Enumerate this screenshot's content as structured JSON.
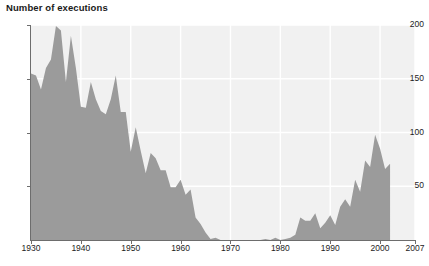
{
  "chart_data": {
    "type": "area",
    "title": "Number of executions",
    "xlabel": "",
    "ylabel": "Number of executions",
    "xlim": [
      1930,
      2007
    ],
    "ylim": [
      0,
      200
    ],
    "grid": true,
    "legend": "none",
    "fill_color": "#9b9b9b",
    "plot_background": "#f1f1f1",
    "gridline_color": "#ffffff",
    "axis_color": "#6d6d6d",
    "x_ticks": [
      1930,
      1940,
      1950,
      1960,
      1970,
      1980,
      1990,
      2000,
      2007
    ],
    "x_tick_labels": [
      "1930",
      "1940",
      "1950",
      "1960",
      "1970",
      "1980",
      "1990",
      "2000",
      "2007"
    ],
    "y_ticks": [
      50,
      100,
      150,
      200
    ],
    "y_tick_labels": [
      "50",
      "100",
      "150",
      "200"
    ],
    "x": [
      1930,
      1931,
      1932,
      1933,
      1934,
      1935,
      1936,
      1937,
      1938,
      1939,
      1940,
      1941,
      1942,
      1943,
      1944,
      1945,
      1946,
      1947,
      1948,
      1949,
      1950,
      1951,
      1952,
      1953,
      1954,
      1955,
      1956,
      1957,
      1958,
      1959,
      1960,
      1961,
      1962,
      1963,
      1964,
      1965,
      1966,
      1967,
      1968,
      1969,
      1970,
      1971,
      1972,
      1973,
      1974,
      1975,
      1976,
      1977,
      1978,
      1979,
      1980,
      1981,
      1982,
      1983,
      1984,
      1985,
      1986,
      1987,
      1988,
      1989,
      1990,
      1991,
      1992,
      1993,
      1994,
      1995,
      1996,
      1997,
      1998,
      1999,
      2000,
      2001,
      2002
    ],
    "values": [
      155,
      153,
      140,
      160,
      168,
      199,
      195,
      147,
      190,
      160,
      124,
      123,
      147,
      131,
      120,
      117,
      131,
      153,
      119,
      119,
      82,
      105,
      83,
      62,
      81,
      76,
      65,
      65,
      49,
      49,
      56,
      42,
      47,
      21,
      15,
      7,
      1,
      2,
      0,
      0,
      0,
      0,
      0,
      0,
      0,
      0,
      0,
      1,
      0,
      2,
      0,
      1,
      2,
      5,
      21,
      18,
      18,
      25,
      11,
      16,
      23,
      14,
      31,
      38,
      31,
      56,
      45,
      74,
      68,
      98,
      85,
      66,
      71
    ],
    "annotations": [
      "Zero executions from 1968 through 1976 (moratorium period)",
      "Peak of 199 executions in 1935",
      "Data series ends in 2002; axis extends to 2007"
    ]
  }
}
